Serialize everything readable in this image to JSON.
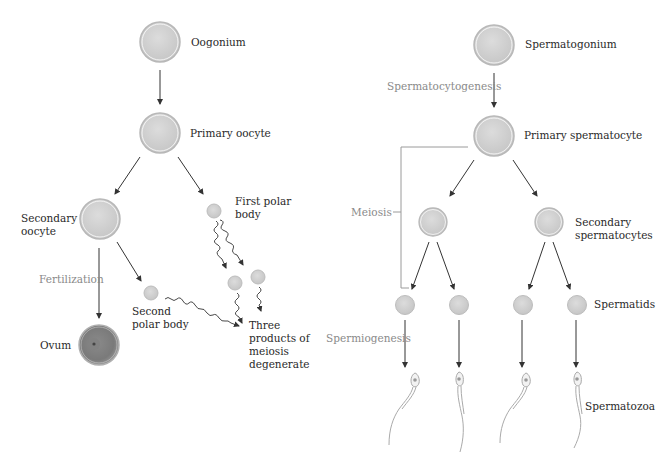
{
  "oogenesis": {
    "oogonium": "Oogonium",
    "primary_oocyte": "Primary oocyte",
    "secondary_oocyte_1": "Secondary",
    "secondary_oocyte_2": "oocyte",
    "first_polar_body_1": "First polar",
    "first_polar_body_2": "body",
    "fertilization": "Fertilization",
    "second_polar_body_1": "Second",
    "second_polar_body_2": "polar body",
    "ovum": "Ovum",
    "degenerate_1": "Three",
    "degenerate_2": "products of",
    "degenerate_3": "meiosis",
    "degenerate_4": "degenerate"
  },
  "spermatogenesis": {
    "spermatogonium": "Spermatogonium",
    "spermatocytogenesis": "Spermatocytogenesis",
    "primary_spermatocyte": "Primary spermatocyte",
    "meiosis": "Meiosis",
    "secondary_spermatocytes_1": "Secondary",
    "secondary_spermatocytes_2": "spermatocytes",
    "spermatids": "Spermatids",
    "spermiogenesis": "Spermiogenesis",
    "spermatozoa": "Spermatozoa"
  },
  "colors": {
    "cell_fill": "#d4d4d4",
    "cell_ring": "#b8b8b8",
    "ovum_fill": "#8c8c8c",
    "arrow": "#333333",
    "process_label": "#8a8a8a",
    "bracket": "#9a9a9a"
  }
}
